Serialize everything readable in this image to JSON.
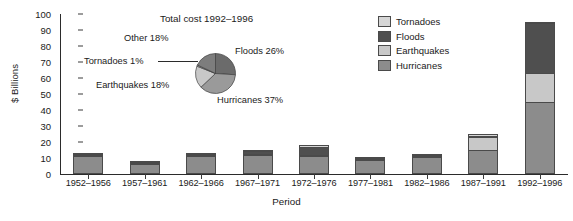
{
  "chart_data": {
    "type": "bar",
    "subtype": "stacked-bar-with-inset-pie",
    "title": "",
    "xlabel": "Period",
    "ylabel": "$ Billions",
    "ylim": [
      0,
      100
    ],
    "ytick_step": 10,
    "yticks": [
      0,
      10,
      20,
      30,
      40,
      50,
      60,
      70,
      80,
      90,
      100
    ],
    "grid": false,
    "legend_position": "top-right",
    "categories": [
      "1952–1956",
      "1957–1961",
      "1962–1966",
      "1967–1971",
      "1972–1976",
      "1977–1981",
      "1982–1986",
      "1987–1991",
      "1992–1996"
    ],
    "series": [
      {
        "name": "Hurricanes",
        "color": "#8c8c8c",
        "values": [
          11.0,
          6.5,
          11.5,
          12.0,
          11.0,
          9.0,
          10.5,
          15.0,
          45.0
        ]
      },
      {
        "name": "Earthquakes",
        "color": "#c8c8c8",
        "values": [
          0.5,
          0.3,
          0.5,
          0.5,
          0.5,
          0.4,
          0.5,
          8.0,
          18.0
        ]
      },
      {
        "name": "Floods",
        "color": "#4f4f4f",
        "values": [
          1.0,
          0.2,
          0.7,
          1.5,
          5.5,
          0.4,
          0.7,
          1.0,
          31.5
        ]
      },
      {
        "name": "Tornadoes",
        "color": "#d6d6d6",
        "values": [
          0.5,
          0.3,
          0.5,
          1.0,
          1.0,
          0.4,
          0.5,
          1.0,
          0.5
        ]
      }
    ],
    "totals": [
      13,
      7,
      13,
      15,
      18,
      10,
      12,
      25,
      95
    ],
    "stack_order_bottom_to_top": [
      "Hurricanes",
      "Earthquakes",
      "Floods",
      "Tornadoes"
    ],
    "inset_pie": {
      "type": "pie",
      "title": "Total cost 1992–1996",
      "labels": [
        "Floods",
        "Hurricanes",
        "Earthquakes",
        "Tornadoes",
        "Other"
      ],
      "values": [
        26,
        37,
        18,
        1,
        18
      ],
      "display": [
        "Floods 26%",
        "Hurricanes 37%",
        "Earthquakes 18%",
        "Tornadoes 1%",
        "Other 18%"
      ],
      "colors": [
        "#6b6b6b",
        "#9a9a9a",
        "#c8c8c8",
        "#b0b0b0",
        "#7d7d7d"
      ]
    }
  },
  "legend": {
    "items": [
      {
        "label": "Tornadoes",
        "color": "#d6d6d6"
      },
      {
        "label": "Floods",
        "color": "#4f4f4f"
      },
      {
        "label": "Earthquakes",
        "color": "#c8c8c8"
      },
      {
        "label": "Hurricanes",
        "color": "#8c8c8c"
      }
    ]
  },
  "axes": {
    "y_title": "$ Billions",
    "x_title": "Period"
  },
  "pie_labels": {
    "other": "Other 18%",
    "floods": "Floods 26%",
    "tornadoes": "Tornadoes 1%",
    "earthquakes": "Earthquakes 18%",
    "hurricanes": "Hurricanes 37%",
    "title": "Total cost 1992–1996"
  }
}
